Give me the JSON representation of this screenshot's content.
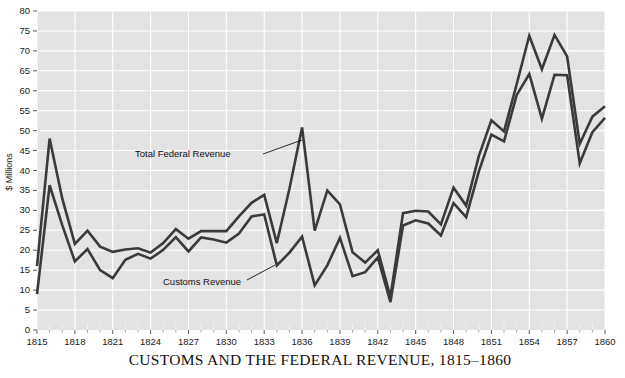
{
  "chart_data": {
    "type": "line",
    "title": "CUSTOMS AND THE FEDERAL REVENUE, 1815–1860",
    "xlabel": "",
    "ylabel": "$ Millions",
    "xlim": [
      1815,
      1860
    ],
    "ylim": [
      0,
      80
    ],
    "grid": true,
    "legend_position": "inline-annotations",
    "x": [
      1815,
      1816,
      1817,
      1818,
      1819,
      1820,
      1821,
      1822,
      1823,
      1824,
      1825,
      1826,
      1827,
      1828,
      1829,
      1830,
      1831,
      1832,
      1833,
      1834,
      1835,
      1836,
      1837,
      1838,
      1839,
      1840,
      1841,
      1842,
      1843,
      1844,
      1845,
      1846,
      1847,
      1848,
      1849,
      1850,
      1851,
      1852,
      1853,
      1854,
      1855,
      1856,
      1857,
      1858,
      1859,
      1860
    ],
    "ytick_labels": [
      "0",
      "5",
      "10",
      "15",
      "20",
      "25",
      "30",
      "35",
      "40",
      "45",
      "50",
      "55",
      "60",
      "65",
      "70",
      "75",
      "80"
    ],
    "ytick_values": [
      0,
      5,
      10,
      15,
      20,
      25,
      30,
      35,
      40,
      45,
      50,
      55,
      60,
      65,
      70,
      75,
      80
    ],
    "xtick_labels": [
      "1815",
      "1818",
      "1821",
      "1824",
      "1827",
      "1830",
      "1833",
      "1836",
      "1839",
      "1842",
      "1845",
      "1848",
      "1851",
      "1854",
      "1857",
      "1860"
    ],
    "xtick_values": [
      1815,
      1818,
      1821,
      1824,
      1827,
      1830,
      1833,
      1836,
      1839,
      1842,
      1845,
      1848,
      1851,
      1854,
      1857,
      1860
    ],
    "series": [
      {
        "name": "Total Federal Revenue",
        "color": "#3a3a3a",
        "values": [
          16.0,
          48.0,
          33.0,
          21.6,
          24.9,
          20.9,
          19.6,
          20.2,
          20.5,
          19.4,
          21.8,
          25.3,
          22.9,
          24.8,
          24.8,
          24.8,
          28.5,
          31.9,
          33.9,
          21.8,
          35.4,
          50.8,
          24.9,
          35.0,
          31.5,
          19.5,
          16.9,
          20.0,
          8.3,
          29.3,
          29.9,
          29.7,
          26.5,
          35.7,
          31.2,
          43.6,
          52.6,
          49.8,
          61.6,
          73.8,
          65.4,
          74.0,
          68.6,
          46.7,
          53.5,
          56.1
        ]
      },
      {
        "name": "Customs Revenue",
        "color": "#3a3a3a",
        "values": [
          9.0,
          36.3,
          26.3,
          17.2,
          20.3,
          15.0,
          13.0,
          17.6,
          19.1,
          17.9,
          20.1,
          23.3,
          19.7,
          23.2,
          22.7,
          21.9,
          24.2,
          28.5,
          29.0,
          16.2,
          19.4,
          23.4,
          11.2,
          16.2,
          23.1,
          13.5,
          14.5,
          18.2,
          7.0,
          26.2,
          27.5,
          26.7,
          23.7,
          31.8,
          28.3,
          39.7,
          49.0,
          47.3,
          58.9,
          64.2,
          53.0,
          64.0,
          63.9,
          41.8,
          49.6,
          53.2
        ]
      }
    ],
    "annotations": [
      {
        "label": "Total Federal Revenue",
        "text_x": 135,
        "text_y": 157,
        "leader_from_x": 263,
        "leader_from_y": 154,
        "leader_to_x": 302,
        "leader_to_y": 140
      },
      {
        "label": "Customs Revenue",
        "text_x": 163,
        "text_y": 285,
        "leader_from_x": 247,
        "leader_from_y": 280,
        "leader_to_x": 275,
        "leader_to_y": 265
      }
    ]
  },
  "colors": {
    "plot_background": "#e3e3e3",
    "page_background": "#ffffff",
    "gridline": "#ffffff",
    "line": "#3a3a3a",
    "text": "#111111"
  }
}
